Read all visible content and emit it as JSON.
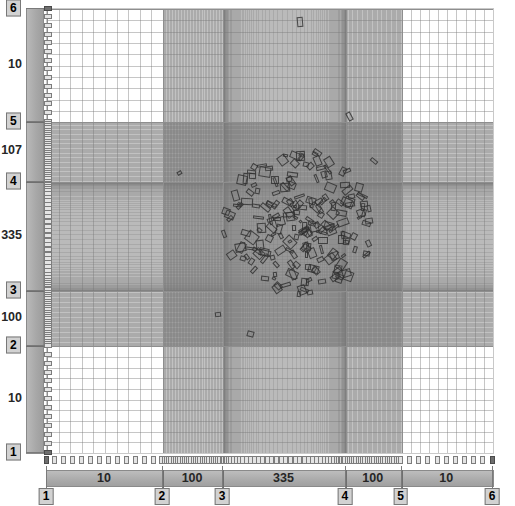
{
  "view": {
    "title": "Mesh grading editor",
    "background_color": "#ffffff",
    "mesh_line_color": "#9a9a9a",
    "major_line_color": "#8e8e8e",
    "building_outline_color": "#3a3a3a",
    "axis_bar_color": "#aeaeae",
    "tick_box_color": "#d2d2d2"
  },
  "x_axis": {
    "name": "horizontal-grading-axis",
    "tick_labels": [
      "1",
      "2",
      "3",
      "4",
      "5",
      "6"
    ],
    "tick_positions_pct": [
      0,
      26.0,
      39.5,
      67.0,
      79.5,
      100
    ],
    "segment_labels": [
      "10",
      "100",
      "335",
      "100",
      "10"
    ],
    "segment_cell_counts": [
      10,
      100,
      335,
      100,
      10
    ]
  },
  "y_axis": {
    "name": "vertical-grading-axis",
    "tick_labels": [
      "6",
      "5",
      "4",
      "3",
      "2",
      "1"
    ],
    "tick_positions_pct": [
      0,
      25.5,
      39.0,
      63.5,
      76.0,
      100
    ],
    "segment_labels": [
      "10",
      "107",
      "335",
      "100",
      "10"
    ],
    "segment_cell_counts": [
      10,
      107,
      335,
      100,
      10
    ]
  },
  "chart_data": {
    "type": "heatmap",
    "xlabel": "",
    "ylabel": "",
    "grid": true,
    "legend": "none",
    "x_divisions": [
      "1",
      "2",
      "3",
      "4",
      "5",
      "6"
    ],
    "y_divisions": [
      "6",
      "5",
      "4",
      "3",
      "2",
      "1"
    ],
    "x_segment_counts": [
      10,
      100,
      335,
      100,
      10
    ],
    "y_segment_counts": [
      10,
      107,
      335,
      100,
      10
    ],
    "x_total_cells": 555,
    "y_total_cells": 562,
    "xlim": [
      1,
      6
    ],
    "ylim": [
      1,
      6
    ]
  }
}
